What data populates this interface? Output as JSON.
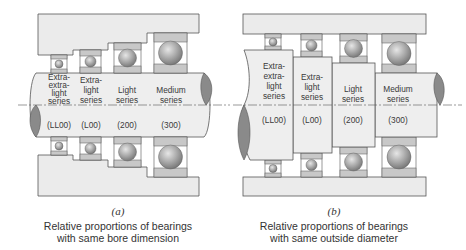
{
  "panels": [
    {
      "id": "a",
      "label": "(a)",
      "caption_line1": "Relative proportions of bearings",
      "caption_line2": "with same bore dimension",
      "series": [
        {
          "name_lines": [
            "Extra-",
            "extra-",
            "light",
            "series"
          ],
          "code": "(LL00)"
        },
        {
          "name_lines": [
            "Extra-",
            "light",
            "series"
          ],
          "code": "(L00)"
        },
        {
          "name_lines": [
            "Light",
            "series"
          ],
          "code": "(200)"
        },
        {
          "name_lines": [
            "Medium",
            "series"
          ],
          "code": "(300)"
        }
      ]
    },
    {
      "id": "b",
      "label": "(b)",
      "caption_line1": "Relative proportions of bearings",
      "caption_line2": "with same outside diameter",
      "series": [
        {
          "name_lines": [
            "Extra-",
            "extra-",
            "light",
            "series"
          ],
          "code": "(LL00)"
        },
        {
          "name_lines": [
            "Extra-",
            "light",
            "series"
          ],
          "code": "(L00)"
        },
        {
          "name_lines": [
            "Light",
            "series"
          ],
          "code": "(200)"
        },
        {
          "name_lines": [
            "Medium",
            "series"
          ],
          "code": "(300)"
        }
      ]
    }
  ],
  "colors": {
    "housing": "#ebebeb",
    "shaft": "#eeeeee",
    "race": "#c8c8c8",
    "outline": "#555555",
    "ball": "#a8a8a8",
    "shaft_end": "#8a8a8a"
  }
}
